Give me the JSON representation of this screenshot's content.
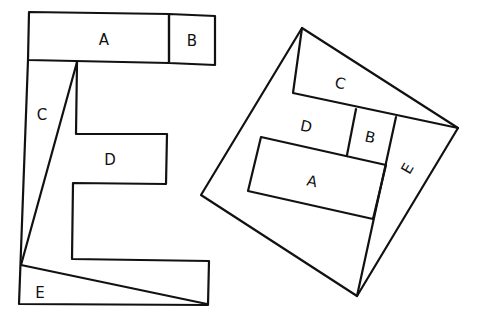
{
  "diagram": {
    "left_figure": {
      "name": "letter-E",
      "pieces": [
        {
          "label": "A",
          "x": 104,
          "y": 40
        },
        {
          "label": "B",
          "x": 192,
          "y": 41
        },
        {
          "label": "C",
          "x": 42,
          "y": 115
        },
        {
          "label": "D",
          "x": 110,
          "y": 160
        },
        {
          "label": "E",
          "x": 40,
          "y": 293
        }
      ]
    },
    "right_figure": {
      "name": "square",
      "pieces": [
        {
          "label": "C",
          "x": 340,
          "y": 84
        },
        {
          "label": "D",
          "x": 306,
          "y": 127
        },
        {
          "label": "B",
          "x": 370,
          "y": 138
        },
        {
          "label": "A",
          "x": 312,
          "y": 182
        },
        {
          "label": "E",
          "x": 408,
          "y": 169
        }
      ]
    }
  }
}
